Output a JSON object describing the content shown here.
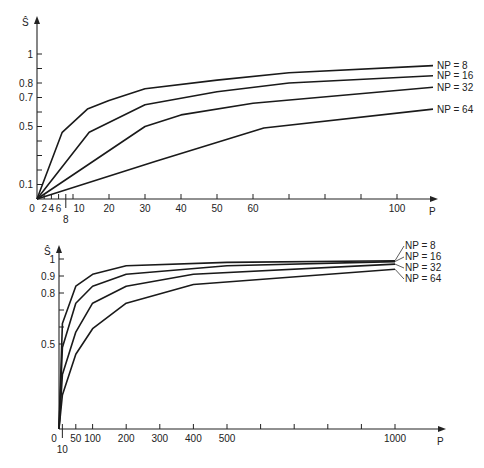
{
  "chart_data": [
    {
      "type": "line",
      "title": "",
      "xlabel": "P",
      "ylabel": "Ŝ",
      "xlim": [
        0,
        115
      ],
      "ylim": [
        0,
        1.1
      ],
      "grid": false,
      "legend_position": "right, inline at line ends",
      "x_tick_labels": [
        "0",
        "2",
        "4",
        "6",
        "8",
        "10",
        "20",
        "30",
        "40",
        "50",
        "60",
        "100"
      ],
      "x_ticks_unlabeled": [
        70,
        80,
        90
      ],
      "y_tick_labels": [
        "0.1",
        "0.5",
        "0.7",
        "0.8",
        "1"
      ],
      "y_ticks_unlabeled": [
        0.2,
        0.3,
        0.4,
        0.6,
        0.9
      ],
      "series": [
        {
          "name": "NP = 8",
          "x": [
            0,
            7,
            14,
            20,
            30,
            50,
            70,
            110
          ],
          "values": [
            0,
            0.46,
            0.62,
            0.68,
            0.76,
            0.82,
            0.87,
            0.92
          ]
        },
        {
          "name": "NP = 16",
          "x": [
            0,
            14.5,
            30,
            50,
            70,
            110
          ],
          "values": [
            0,
            0.46,
            0.65,
            0.74,
            0.8,
            0.85
          ]
        },
        {
          "name": "NP = 32",
          "x": [
            0,
            30,
            40,
            60,
            110
          ],
          "values": [
            0,
            0.5,
            0.58,
            0.66,
            0.77
          ]
        },
        {
          "name": "NP = 64",
          "x": [
            0,
            33,
            63,
            110
          ],
          "values": [
            0,
            0.26,
            0.49,
            0.62
          ]
        }
      ]
    },
    {
      "type": "line",
      "title": "",
      "xlabel": "P",
      "ylabel": "Ŝ",
      "xlim": [
        0,
        1150
      ],
      "ylim": [
        0,
        1.1
      ],
      "grid": false,
      "legend_position": "right, fanned leader lines",
      "x_tick_labels": [
        "0",
        "10",
        "50",
        "100",
        "200",
        "300",
        "400",
        "500",
        "1000"
      ],
      "x_ticks_unlabeled": [
        600,
        700,
        800,
        900
      ],
      "y_tick_labels": [
        "0.5",
        "0.8",
        "0.9",
        "1"
      ],
      "y_ticks_unlabeled": [
        0.6,
        0.7
      ],
      "series": [
        {
          "name": "NP = 8",
          "x": [
            0,
            10,
            50,
            100,
            200,
            500,
            1000
          ],
          "values": [
            0,
            0.62,
            0.84,
            0.91,
            0.96,
            0.98,
            0.99
          ]
        },
        {
          "name": "NP = 16",
          "x": [
            0,
            10,
            50,
            100,
            200,
            500,
            1000
          ],
          "values": [
            0,
            0.48,
            0.74,
            0.84,
            0.91,
            0.96,
            0.985
          ]
        },
        {
          "name": "NP = 32",
          "x": [
            0,
            10,
            50,
            100,
            200,
            400,
            1000
          ],
          "values": [
            0,
            0.32,
            0.57,
            0.74,
            0.84,
            0.91,
            0.97
          ]
        },
        {
          "name": "NP = 64",
          "x": [
            0,
            10,
            50,
            100,
            200,
            400,
            1000
          ],
          "values": [
            0,
            0.2,
            0.44,
            0.59,
            0.74,
            0.85,
            0.94
          ]
        }
      ]
    }
  ],
  "figure": {
    "top": {
      "y_axis_label": "Ŝ",
      "x_axis_label": "P",
      "legend": [
        "NP = 8",
        "NP = 16",
        "NP = 32",
        "NP = 64"
      ]
    },
    "bottom": {
      "y_axis_label": "Ŝ",
      "x_axis_label": "P",
      "legend": [
        "NP = 8",
        "NP = 16",
        "NP = 32",
        "NP = 64"
      ]
    }
  }
}
